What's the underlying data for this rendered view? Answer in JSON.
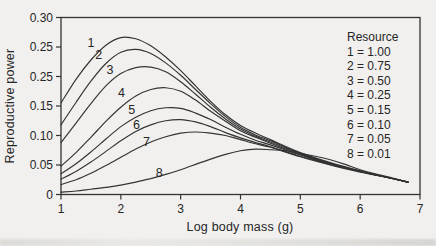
{
  "figure": {
    "background": "#f1f0ee",
    "ink": "#333333"
  },
  "chart_data": {
    "type": "line",
    "title": "",
    "xlabel": "Log body mass (g)",
    "ylabel": "Reproductive power",
    "xlim": [
      1,
      7
    ],
    "ylim": [
      0,
      0.3
    ],
    "grid": false,
    "frame": true,
    "x_ticks": [
      {
        "value": 1,
        "label": "1"
      },
      {
        "value": 2,
        "label": "2"
      },
      {
        "value": 3,
        "label": "3"
      },
      {
        "value": 4,
        "label": "4"
      },
      {
        "value": 5,
        "label": "5"
      },
      {
        "value": 6,
        "label": "6"
      },
      {
        "value": 7,
        "label": "7"
      }
    ],
    "y_ticks": [
      {
        "value": 0.3,
        "label": "0.30"
      },
      {
        "value": 0.25,
        "label": "0.25"
      },
      {
        "value": 0.2,
        "label": "0.25"
      },
      {
        "value": 0.15,
        "label": "0.15"
      },
      {
        "value": 0.1,
        "label": "0.10"
      },
      {
        "value": 0.05,
        "label": "0.05"
      },
      {
        "value": 0.0,
        "label": "0"
      }
    ],
    "legend": {
      "title": "Resource",
      "position": "upper right",
      "entries": [
        "1 = 1.00",
        "2 = 0.75",
        "3 = 0.50",
        "4 = 0.25",
        "5 = 0.15",
        "6 = 0.10",
        "7 = 0.05",
        "8 = 0.01"
      ]
    },
    "series": [
      {
        "label": "1",
        "resource": 1.0,
        "label_pos": {
          "x": 1.5,
          "y": 0.256
        },
        "points": [
          [
            1,
            0.155
          ],
          [
            1.25,
            0.195
          ],
          [
            1.5,
            0.228
          ],
          [
            1.75,
            0.253
          ],
          [
            2,
            0.266
          ],
          [
            2.25,
            0.264
          ],
          [
            2.5,
            0.252
          ],
          [
            2.75,
            0.233
          ],
          [
            3,
            0.21
          ],
          [
            3.25,
            0.184
          ],
          [
            3.5,
            0.158
          ],
          [
            3.75,
            0.135
          ],
          [
            4,
            0.117
          ],
          [
            4.25,
            0.104
          ],
          [
            4.5,
            0.093
          ],
          [
            5,
            0.071
          ],
          [
            5.5,
            0.054
          ],
          [
            6,
            0.04
          ],
          [
            6.5,
            0.028
          ],
          [
            6.8,
            0.021
          ]
        ]
      },
      {
        "label": "2",
        "resource": 0.75,
        "label_pos": {
          "x": 1.63,
          "y": 0.236
        },
        "points": [
          [
            1,
            0.118
          ],
          [
            1.25,
            0.156
          ],
          [
            1.5,
            0.192
          ],
          [
            1.75,
            0.222
          ],
          [
            2,
            0.241
          ],
          [
            2.25,
            0.246
          ],
          [
            2.5,
            0.239
          ],
          [
            2.75,
            0.223
          ],
          [
            3,
            0.202
          ],
          [
            3.25,
            0.178
          ],
          [
            3.5,
            0.154
          ],
          [
            3.75,
            0.132
          ],
          [
            4,
            0.114
          ],
          [
            4.25,
            0.101
          ],
          [
            4.5,
            0.091
          ],
          [
            5,
            0.07
          ],
          [
            5.5,
            0.053
          ],
          [
            6,
            0.04
          ],
          [
            6.5,
            0.028
          ],
          [
            6.8,
            0.021
          ]
        ]
      },
      {
        "label": "3",
        "resource": 0.5,
        "label_pos": {
          "x": 1.82,
          "y": 0.211
        },
        "points": [
          [
            1,
            0.088
          ],
          [
            1.25,
            0.121
          ],
          [
            1.5,
            0.154
          ],
          [
            1.75,
            0.184
          ],
          [
            2,
            0.205
          ],
          [
            2.25,
            0.215
          ],
          [
            2.5,
            0.216
          ],
          [
            2.75,
            0.208
          ],
          [
            3,
            0.191
          ],
          [
            3.25,
            0.17
          ],
          [
            3.5,
            0.148
          ],
          [
            3.75,
            0.128
          ],
          [
            4,
            0.111
          ],
          [
            4.25,
            0.099
          ],
          [
            4.5,
            0.089
          ],
          [
            5,
            0.069
          ],
          [
            5.5,
            0.053
          ],
          [
            6,
            0.039
          ],
          [
            6.5,
            0.028
          ],
          [
            6.8,
            0.021
          ]
        ]
      },
      {
        "label": "4",
        "resource": 0.25,
        "label_pos": {
          "x": 2.01,
          "y": 0.172
        },
        "points": [
          [
            1,
            0.048
          ],
          [
            1.25,
            0.071
          ],
          [
            1.5,
            0.097
          ],
          [
            1.75,
            0.124
          ],
          [
            2,
            0.148
          ],
          [
            2.25,
            0.167
          ],
          [
            2.5,
            0.178
          ],
          [
            2.75,
            0.181
          ],
          [
            3,
            0.175
          ],
          [
            3.25,
            0.16
          ],
          [
            3.5,
            0.141
          ],
          [
            3.75,
            0.124
          ],
          [
            4,
            0.108
          ],
          [
            4.25,
            0.097
          ],
          [
            4.5,
            0.087
          ],
          [
            5,
            0.068
          ],
          [
            5.5,
            0.052
          ],
          [
            6,
            0.039
          ],
          [
            6.5,
            0.028
          ],
          [
            6.8,
            0.021
          ]
        ]
      },
      {
        "label": "5",
        "resource": 0.15,
        "label_pos": {
          "x": 2.18,
          "y": 0.143
        },
        "points": [
          [
            1,
            0.035
          ],
          [
            1.25,
            0.052
          ],
          [
            1.5,
            0.072
          ],
          [
            1.75,
            0.094
          ],
          [
            2,
            0.115
          ],
          [
            2.25,
            0.131
          ],
          [
            2.5,
            0.142
          ],
          [
            2.75,
            0.147
          ],
          [
            3,
            0.146
          ],
          [
            3.25,
            0.138
          ],
          [
            3.5,
            0.127
          ],
          [
            3.75,
            0.114
          ],
          [
            4,
            0.102
          ],
          [
            4.25,
            0.092
          ],
          [
            4.5,
            0.084
          ],
          [
            5,
            0.067
          ],
          [
            5.5,
            0.051
          ],
          [
            6,
            0.039
          ],
          [
            6.5,
            0.028
          ],
          [
            6.8,
            0.021
          ]
        ]
      },
      {
        "label": "6",
        "resource": 0.1,
        "label_pos": {
          "x": 2.26,
          "y": 0.118
        },
        "points": [
          [
            1,
            0.026
          ],
          [
            1.25,
            0.039
          ],
          [
            1.5,
            0.055
          ],
          [
            1.75,
            0.073
          ],
          [
            2,
            0.091
          ],
          [
            2.25,
            0.107
          ],
          [
            2.5,
            0.118
          ],
          [
            2.75,
            0.125
          ],
          [
            3,
            0.127
          ],
          [
            3.25,
            0.123
          ],
          [
            3.5,
            0.115
          ],
          [
            3.75,
            0.105
          ],
          [
            4,
            0.096
          ],
          [
            4.25,
            0.088
          ],
          [
            4.5,
            0.081
          ],
          [
            5,
            0.065
          ],
          [
            5.5,
            0.051
          ],
          [
            6,
            0.039
          ],
          [
            6.5,
            0.028
          ],
          [
            6.8,
            0.021
          ]
        ]
      },
      {
        "label": "7",
        "resource": 0.05,
        "label_pos": {
          "x": 2.43,
          "y": 0.089
        },
        "points": [
          [
            1,
            0.017
          ],
          [
            1.25,
            0.025
          ],
          [
            1.5,
            0.036
          ],
          [
            1.75,
            0.049
          ],
          [
            2,
            0.063
          ],
          [
            2.25,
            0.077
          ],
          [
            2.5,
            0.089
          ],
          [
            2.75,
            0.098
          ],
          [
            3,
            0.104
          ],
          [
            3.25,
            0.106
          ],
          [
            3.5,
            0.104
          ],
          [
            3.75,
            0.1
          ],
          [
            4,
            0.093
          ],
          [
            4.25,
            0.086
          ],
          [
            4.5,
            0.08
          ],
          [
            5,
            0.064
          ],
          [
            5.5,
            0.05
          ],
          [
            6,
            0.038
          ],
          [
            6.5,
            0.028
          ],
          [
            6.8,
            0.021
          ]
        ]
      },
      {
        "label": "8",
        "resource": 0.01,
        "label_pos": {
          "x": 2.64,
          "y": 0.036
        },
        "points": [
          [
            1,
            0.004
          ],
          [
            1.25,
            0.006
          ],
          [
            1.5,
            0.009
          ],
          [
            1.75,
            0.012
          ],
          [
            2,
            0.016
          ],
          [
            2.25,
            0.021
          ],
          [
            2.5,
            0.027
          ],
          [
            2.75,
            0.034
          ],
          [
            3,
            0.042
          ],
          [
            3.25,
            0.051
          ],
          [
            3.5,
            0.06
          ],
          [
            3.75,
            0.068
          ],
          [
            4,
            0.074
          ],
          [
            4.25,
            0.077
          ],
          [
            4.5,
            0.076
          ],
          [
            4.75,
            0.074
          ],
          [
            5,
            0.07
          ],
          [
            5.25,
            0.065
          ],
          [
            5.5,
            0.059
          ],
          [
            5.75,
            0.051
          ],
          [
            6,
            0.042
          ],
          [
            6.25,
            0.035
          ],
          [
            6.5,
            0.029
          ],
          [
            6.8,
            0.021
          ]
        ]
      }
    ]
  }
}
